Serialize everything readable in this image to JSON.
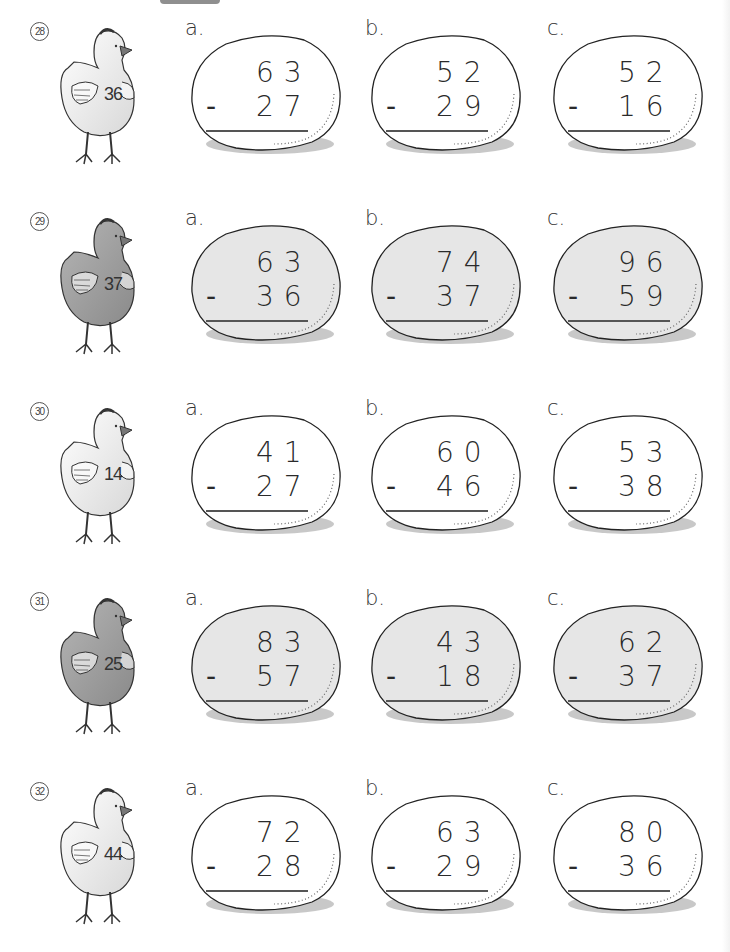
{
  "worksheet": {
    "problems": [
      {
        "number": "28",
        "chicken_value": "36",
        "chicken_shade": "light",
        "egg_fill": "#ffffff",
        "items": [
          {
            "letter": "a.",
            "minuend": "63",
            "subtrahend": "27",
            "operator": "-"
          },
          {
            "letter": "b.",
            "minuend": "52",
            "subtrahend": "29",
            "operator": "-"
          },
          {
            "letter": "c.",
            "minuend": "52",
            "subtrahend": "16",
            "operator": "-"
          }
        ]
      },
      {
        "number": "29",
        "chicken_value": "37",
        "chicken_shade": "dark",
        "egg_fill": "#e6e6e6",
        "items": [
          {
            "letter": "a.",
            "minuend": "63",
            "subtrahend": "36",
            "operator": "-"
          },
          {
            "letter": "b.",
            "minuend": "74",
            "subtrahend": "37",
            "operator": "-"
          },
          {
            "letter": "c.",
            "minuend": "96",
            "subtrahend": "59",
            "operator": "-"
          }
        ]
      },
      {
        "number": "30",
        "chicken_value": "14",
        "chicken_shade": "light",
        "egg_fill": "#ffffff",
        "items": [
          {
            "letter": "a.",
            "minuend": "41",
            "subtrahend": "27",
            "operator": "-"
          },
          {
            "letter": "b.",
            "minuend": "60",
            "subtrahend": "46",
            "operator": "-"
          },
          {
            "letter": "c.",
            "minuend": "53",
            "subtrahend": "38",
            "operator": "-"
          }
        ]
      },
      {
        "number": "31",
        "chicken_value": "25",
        "chicken_shade": "dark",
        "egg_fill": "#e6e6e6",
        "items": [
          {
            "letter": "a.",
            "minuend": "83",
            "subtrahend": "57",
            "operator": "-"
          },
          {
            "letter": "b.",
            "minuend": "43",
            "subtrahend": "18",
            "operator": "-"
          },
          {
            "letter": "c.",
            "minuend": "62",
            "subtrahend": "37",
            "operator": "-"
          }
        ]
      },
      {
        "number": "32",
        "chicken_value": "44",
        "chicken_shade": "light",
        "egg_fill": "#ffffff",
        "items": [
          {
            "letter": "a.",
            "minuend": "72",
            "subtrahend": "28",
            "operator": "-"
          },
          {
            "letter": "b.",
            "minuend": "63",
            "subtrahend": "29",
            "operator": "-"
          },
          {
            "letter": "c.",
            "minuend": "80",
            "subtrahend": "36",
            "operator": "-"
          }
        ]
      }
    ]
  },
  "colors": {
    "ink": "#2a2a2a",
    "light_chicken": "#f4f4f4",
    "dark_chicken": "#8a8a8a",
    "dark_egg": "#e6e6e6",
    "egg_shadow": "#9a9a9a"
  }
}
